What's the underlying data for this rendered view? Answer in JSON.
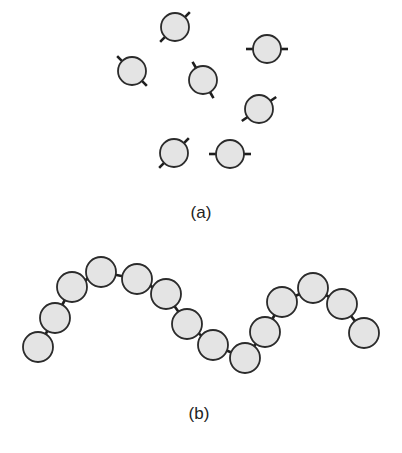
{
  "figure": {
    "panel_a": {
      "label": "(a)",
      "label_pos": [
        201,
        218
      ],
      "description": "Separate monomer units, each with two bonding sites",
      "radius": 14,
      "monomers": [
        {
          "cx": 175,
          "cy": 27,
          "angle": -45
        },
        {
          "cx": 132,
          "cy": 71,
          "angle": 45
        },
        {
          "cx": 203,
          "cy": 80,
          "angle": 60
        },
        {
          "cx": 267,
          "cy": 49,
          "angle": 0
        },
        {
          "cx": 259,
          "cy": 109,
          "angle": -35
        },
        {
          "cx": 174,
          "cy": 153,
          "angle": -45
        },
        {
          "cx": 230,
          "cy": 154,
          "angle": 0
        }
      ]
    },
    "panel_b": {
      "label": "(b)",
      "label_pos": [
        199,
        419
      ],
      "description": "Monomers linked into a polymer chain",
      "radius": 15,
      "beads": [
        {
          "cx": 38,
          "cy": 347
        },
        {
          "cx": 55,
          "cy": 318
        },
        {
          "cx": 72,
          "cy": 287
        },
        {
          "cx": 101,
          "cy": 272
        },
        {
          "cx": 137,
          "cy": 279
        },
        {
          "cx": 166,
          "cy": 294
        },
        {
          "cx": 187,
          "cy": 324
        },
        {
          "cx": 213,
          "cy": 345
        },
        {
          "cx": 245,
          "cy": 358
        },
        {
          "cx": 265,
          "cy": 332
        },
        {
          "cx": 282,
          "cy": 302
        },
        {
          "cx": 313,
          "cy": 288
        },
        {
          "cx": 342,
          "cy": 304
        },
        {
          "cx": 364,
          "cy": 333
        }
      ]
    },
    "colors": {
      "fill": "#e4e4e4",
      "stroke": "#2b2b2b",
      "background": "#ffffff"
    }
  }
}
